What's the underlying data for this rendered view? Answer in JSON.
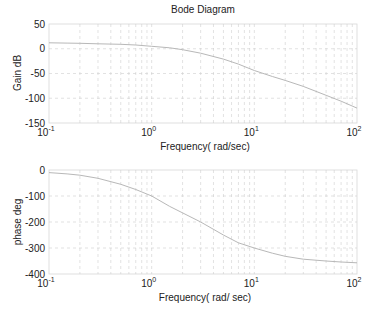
{
  "figure": {
    "title": "Bode Diagram",
    "caption": ""
  },
  "chart_data": [
    {
      "type": "line",
      "title": "Bode Diagram",
      "xlabel": "Frequency( rad/sec)",
      "ylabel": "Gain dB",
      "xscale": "log",
      "xlim": [
        0.1,
        100
      ],
      "ylim": [
        -150,
        50
      ],
      "xticks": [
        0.1,
        1,
        10,
        100
      ],
      "xtick_labels": [
        {
          "base": "10",
          "exp": "-1"
        },
        {
          "base": "10",
          "exp": "0"
        },
        {
          "base": "10",
          "exp": "1"
        },
        {
          "base": "10",
          "exp": "2"
        }
      ],
      "yticks": [
        50,
        0,
        -50,
        -100,
        -150
      ],
      "ytick_labels": [
        "50",
        "0",
        "-50",
        "-100",
        "-150"
      ],
      "grid": true,
      "series": [
        {
          "name": "gain",
          "x": [
            0.1,
            0.15,
            0.2,
            0.3,
            0.5,
            0.7,
            1,
            1.5,
            2,
            3,
            5,
            7,
            10,
            15,
            20,
            30,
            50,
            70,
            100
          ],
          "y": [
            12,
            11.5,
            11,
            10,
            9,
            7.5,
            5,
            2,
            -2,
            -9,
            -21,
            -31,
            -44,
            -56,
            -64,
            -76,
            -94,
            -106,
            -120
          ]
        }
      ]
    },
    {
      "type": "line",
      "title": "",
      "xlabel": "Frequency( rad/ sec)",
      "ylabel": "phase deg",
      "xscale": "log",
      "xlim": [
        0.1,
        100
      ],
      "ylim": [
        -400,
        0
      ],
      "xticks": [
        0.1,
        1,
        10,
        100
      ],
      "xtick_labels": [
        {
          "base": "10",
          "exp": "-1"
        },
        {
          "base": "10",
          "exp": "0"
        },
        {
          "base": "10",
          "exp": "1"
        },
        {
          "base": "10",
          "exp": "2"
        }
      ],
      "yticks": [
        0,
        -100,
        -200,
        -300,
        -400
      ],
      "ytick_labels": [
        "0",
        "-100",
        "-200",
        "-300",
        "-400"
      ],
      "grid": true,
      "series": [
        {
          "name": "phase",
          "x": [
            0.1,
            0.15,
            0.2,
            0.3,
            0.5,
            0.7,
            1,
            1.5,
            2,
            3,
            5,
            7,
            10,
            15,
            20,
            30,
            50,
            70,
            100
          ],
          "y": [
            -10,
            -15,
            -20,
            -32,
            -55,
            -75,
            -100,
            -140,
            -165,
            -200,
            -250,
            -280,
            -300,
            -320,
            -332,
            -343,
            -350,
            -354,
            -357
          ]
        }
      ]
    }
  ],
  "colors": {
    "curve": "#b8b8b8",
    "grid": "#cfcfcf",
    "frame": "#d8d8d8",
    "text": "#222222"
  }
}
